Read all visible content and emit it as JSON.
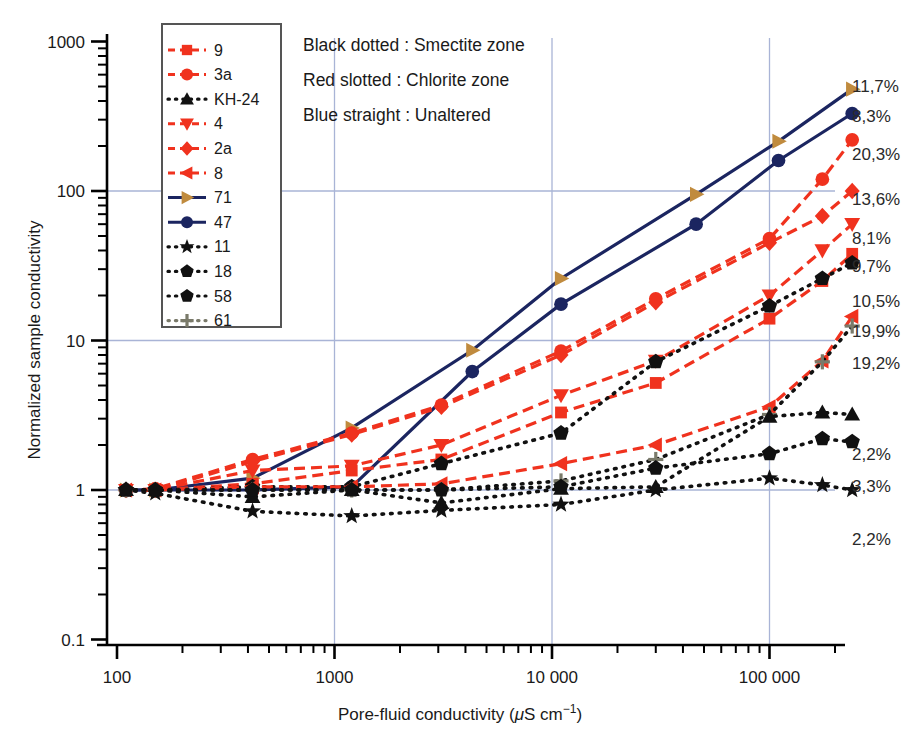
{
  "chart_data": {
    "type": "line",
    "title": "",
    "xlabel": "Pore-fluid conductivity (μS cm⁻¹)",
    "ylabel": "Normalized sample conductivity",
    "xscale": "log",
    "yscale": "log",
    "xlim": [
      100,
      300000
    ],
    "ylim": [
      0.1,
      1000
    ],
    "xticks": [
      100,
      1000,
      10000,
      100000
    ],
    "xtick_labels": [
      "100",
      "1000",
      "10 000",
      "100 000"
    ],
    "yticks": [
      0.1,
      1,
      10,
      100,
      1000
    ],
    "ytick_labels": [
      "0.1",
      "1",
      "10",
      "100",
      "1000"
    ],
    "grid": "major-xy-light-blue",
    "legend_position": "top-left-inside",
    "annotations": [
      "Black dotted : Smectite zone",
      "Red slotted : Chlorite zone",
      "Blue straight : Unaltered"
    ],
    "series": [
      {
        "name": "71",
        "label_right": "11,7%",
        "group": "Unaltered",
        "color": "#c08b3e",
        "line_color": "#1b2560",
        "line_style": "solid",
        "marker": "triangle-right",
        "x": [
          110,
          150,
          420,
          1200,
          4300,
          11000,
          46000,
          110000,
          240000
        ],
        "y": [
          1.0,
          1.0,
          1.2,
          2.6,
          8.6,
          26,
          95,
          215,
          480
        ]
      },
      {
        "name": "47",
        "label_right": "8,3%",
        "group": "Unaltered",
        "color": "#1b2560",
        "line_color": "#1b2560",
        "line_style": "solid",
        "marker": "circle",
        "x": [
          110,
          150,
          420,
          1200,
          4300,
          11000,
          46000,
          110000,
          240000
        ],
        "y": [
          1.0,
          1.0,
          1.0,
          1.05,
          6.2,
          17.5,
          60,
          160,
          330
        ]
      },
      {
        "name": "3a",
        "label_right": "20,3%",
        "group": "Chlorite",
        "color": "#f0321e",
        "line_color": "#f0321e",
        "line_style": "dashed",
        "marker": "diamond-circle",
        "x": [
          110,
          150,
          420,
          1200,
          3100,
          11000,
          30000,
          100000,
          175000,
          240000
        ],
        "y": [
          1.0,
          1.02,
          1.6,
          2.4,
          3.7,
          8.5,
          19,
          48,
          120,
          220
        ]
      },
      {
        "name": "2a",
        "label_right": "13,6%",
        "group": "Chlorite",
        "color": "#f0321e",
        "line_color": "#f0321e",
        "line_style": "dashed",
        "marker": "diamond",
        "x": [
          110,
          150,
          420,
          1200,
          3100,
          11000,
          30000,
          100000,
          175000,
          240000
        ],
        "y": [
          1.0,
          1.0,
          1.55,
          2.35,
          3.6,
          8.0,
          18,
          45,
          68,
          100
        ]
      },
      {
        "name": "4",
        "label_right": "8,1%",
        "group": "Chlorite",
        "color": "#f0321e",
        "line_color": "#f0321e",
        "line_style": "dashed",
        "marker": "triangle-down",
        "x": [
          110,
          150,
          420,
          1200,
          3100,
          11000,
          30000,
          100000,
          175000,
          240000
        ],
        "y": [
          1.0,
          1.0,
          1.35,
          1.45,
          2.0,
          4.3,
          7.3,
          20,
          40,
          60
        ]
      },
      {
        "name": "9",
        "label_right": "9,7%",
        "group": "Chlorite",
        "color": "#f0321e",
        "line_color": "#f0321e",
        "line_style": "dashed",
        "marker": "square",
        "x": [
          110,
          150,
          420,
          1200,
          3100,
          11000,
          30000,
          100000,
          175000,
          240000
        ],
        "y": [
          1.0,
          1.0,
          1.1,
          1.35,
          1.6,
          3.3,
          5.2,
          14,
          25,
          38
        ]
      },
      {
        "name": "58",
        "label_right": "10,5%",
        "group": "Smectite",
        "color": "#111111",
        "line_color": "#111111",
        "line_style": "dotted",
        "marker": "pentagon-dark",
        "x": [
          110,
          150,
          420,
          1200,
          3100,
          11000,
          30000,
          100000,
          175000,
          240000
        ],
        "y": [
          1.0,
          1.0,
          1.05,
          1.05,
          1.5,
          2.4,
          7.2,
          17,
          26,
          33
        ]
      },
      {
        "name": "8",
        "label_right": "19,9%",
        "group": "Chlorite",
        "color": "#f0321e",
        "line_color": "#f0321e",
        "line_style": "dashed",
        "marker": "triangle-left",
        "x": [
          110,
          150,
          420,
          1200,
          3100,
          11000,
          30000,
          100000,
          175000,
          240000
        ],
        "y": [
          1.0,
          1.0,
          1.05,
          1.05,
          1.1,
          1.5,
          2.0,
          3.6,
          7.3,
          14.5
        ]
      },
      {
        "name": "61",
        "label_right": "19,2%",
        "group": "Smectite",
        "color": "#7a7a6a",
        "line_color": "#111111",
        "line_style": "dotted",
        "marker": "plus",
        "x": [
          110,
          150,
          420,
          1200,
          3100,
          11000,
          30000,
          100000,
          175000,
          240000
        ],
        "y": [
          1.0,
          1.0,
          1.0,
          1.0,
          1.0,
          1.15,
          1.6,
          3.2,
          7.2,
          12.5
        ]
      },
      {
        "name": "KH-24",
        "label_right": "2,2%",
        "group": "Smectite",
        "color": "#111111",
        "line_color": "#111111",
        "line_style": "dotted",
        "marker": "triangle-up",
        "x": [
          110,
          150,
          420,
          1200,
          3100,
          11000,
          30000,
          100000,
          175000,
          240000
        ],
        "y": [
          1.0,
          1.0,
          0.9,
          1.0,
          0.82,
          1.02,
          1.05,
          3.1,
          3.3,
          3.2
        ]
      },
      {
        "name": "18",
        "label_right": "3,3%",
        "group": "Smectite",
        "color": "#111111",
        "line_color": "#111111",
        "line_style": "dotted",
        "marker": "pentagon",
        "x": [
          110,
          150,
          420,
          1200,
          3100,
          11000,
          30000,
          100000,
          175000,
          240000
        ],
        "y": [
          1.0,
          1.0,
          1.0,
          1.0,
          1.0,
          1.05,
          1.4,
          1.75,
          2.2,
          2.1
        ]
      },
      {
        "name": "11",
        "label_right": "2,2%",
        "group": "Smectite",
        "color": "#111111",
        "line_color": "#111111",
        "line_style": "dotted",
        "marker": "star",
        "x": [
          110,
          150,
          420,
          1200,
          3100,
          11000,
          30000,
          100000,
          175000,
          240000
        ],
        "y": [
          1.0,
          0.95,
          0.72,
          0.67,
          0.73,
          0.8,
          1.0,
          1.2,
          1.08,
          1.0
        ]
      }
    ]
  },
  "legend": {
    "entries": [
      {
        "label": "9",
        "marker": "square",
        "color": "#f0321e",
        "style": "dashed"
      },
      {
        "label": "3a",
        "marker": "diamond-circle",
        "color": "#f0321e",
        "style": "dashed"
      },
      {
        "label": "KH-24",
        "marker": "triangle-up",
        "color": "#111111",
        "style": "dotted"
      },
      {
        "label": "4",
        "marker": "triangle-down",
        "color": "#f0321e",
        "style": "dashed"
      },
      {
        "label": "2a",
        "marker": "diamond",
        "color": "#f0321e",
        "style": "dashed"
      },
      {
        "label": "8",
        "marker": "triangle-left",
        "color": "#f0321e",
        "style": "dashed"
      },
      {
        "label": "71",
        "marker": "triangle-right",
        "color": "#c08b3e",
        "style": "solid"
      },
      {
        "label": "47",
        "marker": "circle",
        "color": "#1b2560",
        "style": "solid"
      },
      {
        "label": "11",
        "marker": "star",
        "color": "#111111",
        "style": "dotted"
      },
      {
        "label": "18",
        "marker": "pentagon",
        "color": "#111111",
        "style": "dotted"
      },
      {
        "label": "58",
        "marker": "pentagon-dark",
        "color": "#111111",
        "style": "dotted"
      },
      {
        "label": "61",
        "marker": "plus",
        "color": "#7a7a6a",
        "style": "dotted"
      }
    ]
  },
  "colors": {
    "red": "#f0321e",
    "navy": "#1b2560",
    "gold": "#c08b3e",
    "black": "#111111",
    "grid": "#a9b4d6",
    "axis": "#000000"
  }
}
